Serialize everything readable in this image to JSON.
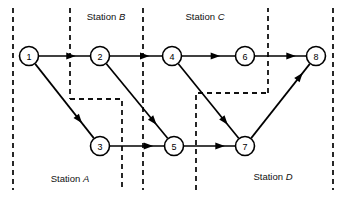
{
  "figure": {
    "type": "directed-graph",
    "background_color": "#ffffff",
    "line_color": "#000000",
    "boundary_color": "#111111"
  },
  "station_labels": [
    {
      "id": "station-a",
      "text": "Station A",
      "name": "A",
      "x": 70,
      "y": 182
    },
    {
      "id": "station-b",
      "text": "Station B",
      "name": "B",
      "x": 106,
      "y": 20
    },
    {
      "id": "station-c",
      "text": "Station C",
      "name": "C",
      "x": 205,
      "y": 20
    },
    {
      "id": "station-d",
      "text": "Station D",
      "name": "D",
      "x": 273,
      "y": 180
    }
  ],
  "nodes": [
    {
      "id": 1,
      "label": "1",
      "x": 29,
      "y": 56,
      "r": 9.5
    },
    {
      "id": 2,
      "label": "2",
      "x": 100,
      "y": 56,
      "r": 9.5
    },
    {
      "id": 3,
      "label": "3",
      "x": 100,
      "y": 146,
      "r": 9.5
    },
    {
      "id": 4,
      "label": "4",
      "x": 172,
      "y": 56,
      "r": 9.5
    },
    {
      "id": 5,
      "label": "5",
      "x": 174,
      "y": 146,
      "r": 9.5
    },
    {
      "id": 6,
      "label": "6",
      "x": 245,
      "y": 56,
      "r": 9.5
    },
    {
      "id": 7,
      "label": "7",
      "x": 245,
      "y": 146,
      "r": 9.5
    },
    {
      "id": 8,
      "label": "8",
      "x": 316,
      "y": 56,
      "r": 9.5
    }
  ],
  "edges": [
    {
      "from": 1,
      "to": 2,
      "arrow_at": 0.72
    },
    {
      "from": 1,
      "to": 3,
      "arrow_at": 0.8
    },
    {
      "from": 2,
      "to": 4,
      "arrow_at": 0.76
    },
    {
      "from": 2,
      "to": 5,
      "arrow_at": 0.82
    },
    {
      "from": 3,
      "to": 5,
      "arrow_at": 0.8
    },
    {
      "from": 4,
      "to": 6,
      "arrow_at": 0.72
    },
    {
      "from": 4,
      "to": 7,
      "arrow_at": 0.82
    },
    {
      "from": 5,
      "to": 7,
      "arrow_at": 0.8
    },
    {
      "from": 6,
      "to": 8,
      "arrow_at": 0.8
    },
    {
      "from": 7,
      "to": 8,
      "arrow_at": 0.88
    }
  ],
  "boundaries": [
    {
      "id": "left-edge",
      "points": "13,8 13,190"
    },
    {
      "id": "station-a-b-left",
      "points": "70,8 70,99"
    },
    {
      "id": "station-a-b-step",
      "points": "70,99 122,99 122,190"
    },
    {
      "id": "station-b-c",
      "points": "143,8 143,190"
    },
    {
      "id": "station-c-d-step",
      "points": "196,190 196,93 268,93"
    },
    {
      "id": "station-c-d-up",
      "points": "268,93 268,8"
    },
    {
      "id": "right-edge",
      "points": "333,8 333,190"
    }
  ]
}
